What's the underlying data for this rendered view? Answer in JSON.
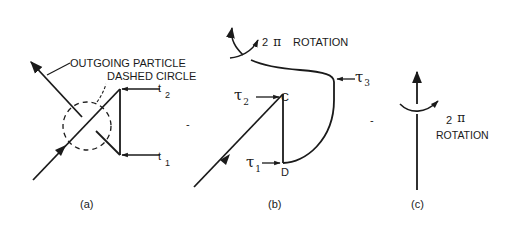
{
  "panel_a": {
    "caption": "(a)",
    "label_outgoing": "OUTGOING PARTICLE",
    "label_dashed": "DASHED CIRCLE",
    "t2_base": "t",
    "t2_sub": "2",
    "t1_base": "t",
    "t1_sub": "1"
  },
  "panel_b": {
    "caption": "(b)",
    "rotation_num": "2",
    "rotation_pi": "π",
    "rotation_word": "ROTATION",
    "tau1_base": "τ",
    "tau1_sub": "1",
    "tau2_base": "τ",
    "tau2_sub": "2",
    "tau3_base": "τ",
    "tau3_sub": "3",
    "point_c": "C",
    "point_d": "D"
  },
  "panel_c": {
    "caption": "(c)",
    "rotation_num": "2",
    "rotation_pi": "π",
    "rotation_word": "ROTATION"
  },
  "separators": [
    "-",
    "-"
  ],
  "colors": {
    "ink": "#1a1a1a",
    "background": "#ffffff"
  }
}
